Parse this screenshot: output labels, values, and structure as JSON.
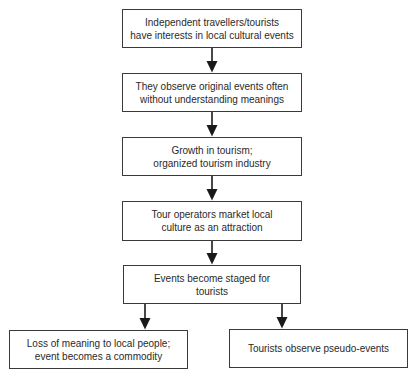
{
  "diagram": {
    "type": "flowchart",
    "nodes": [
      {
        "id": "n1",
        "label": "Independent travellers/tourists\nhave interests in local cultural events"
      },
      {
        "id": "n2",
        "label": "They observe original events often\nwithout understanding meanings"
      },
      {
        "id": "n3",
        "label": "Growth in tourism;\norganized tourism industry"
      },
      {
        "id": "n4",
        "label": "Tour operators market local\nculture as an attraction"
      },
      {
        "id": "n5",
        "label": "Events become staged for\ntourists"
      },
      {
        "id": "n6",
        "label": "Loss of meaning to local people;\nevent becomes a commodity"
      },
      {
        "id": "n7",
        "label": "Tourists observe pseudo-events"
      }
    ],
    "edges": [
      {
        "from": "n1",
        "to": "n2"
      },
      {
        "from": "n2",
        "to": "n3"
      },
      {
        "from": "n3",
        "to": "n4"
      },
      {
        "from": "n4",
        "to": "n5"
      },
      {
        "from": "n5",
        "to": "n6"
      },
      {
        "from": "n5",
        "to": "n7"
      }
    ],
    "colors": {
      "border": "#3a3a3a",
      "arrow": "#1a1a1a",
      "text": "#2a2a2a",
      "background": "#ffffff"
    }
  }
}
